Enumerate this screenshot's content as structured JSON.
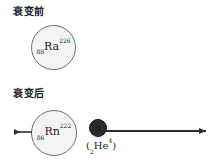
{
  "figure": {
    "title_before": "衰变前",
    "title_after": "衰变后",
    "background_color": "#ffffff",
    "nucleus_fill": "#f4f4f4",
    "nucleus_stroke": "#6d6d6d",
    "particle_fill": "#2b2b2b",
    "arrow_color": "#2b2b2b"
  },
  "parent_nucleus": {
    "symbol": "Ra",
    "atomic_number": "88",
    "mass_number": "226",
    "label": "88Ra226"
  },
  "daughter_nucleus": {
    "symbol": "Rn",
    "atomic_number": "86",
    "mass_number": "222",
    "label": "86Rn222"
  },
  "alpha_particle": {
    "glyph": "α",
    "caption_open": "(",
    "atomic_number": "2",
    "symbol": "He",
    "mass_number": "4",
    "caption_close": ")",
    "caption": "(2He4)"
  },
  "arrows": [
    {
      "name": "recoil-arrow",
      "direction": "left",
      "from_x": 32,
      "to_x": 9,
      "y": 132
    },
    {
      "name": "alpha-arrow",
      "direction": "right",
      "from_x": 101,
      "to_x": 213,
      "y": 131
    }
  ]
}
